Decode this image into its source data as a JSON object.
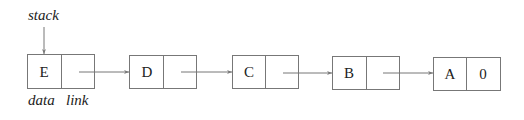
{
  "diagram": {
    "pointer_label": "stack",
    "field_labels": {
      "data": "data",
      "link": "link"
    },
    "nodes": [
      {
        "data": "E",
        "link": ""
      },
      {
        "data": "D",
        "link": ""
      },
      {
        "data": "C",
        "link": ""
      },
      {
        "data": "B",
        "link": ""
      },
      {
        "data": "A",
        "link": "0"
      }
    ],
    "colors": {
      "line": "#777777",
      "text": "#222222",
      "background": "#ffffff"
    }
  }
}
